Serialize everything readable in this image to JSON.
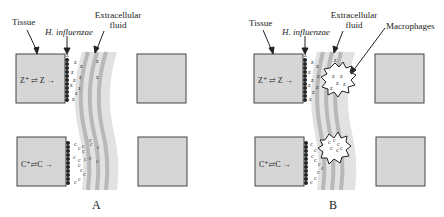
{
  "panels": [
    {
      "id": "A",
      "letter": "A",
      "labels": {
        "tissue": "Tissue",
        "bacteria": "H. influenzae",
        "fluid_line1": "Extracellular",
        "fluid_line2": "fluid"
      },
      "equations": {
        "top": "Z⁺ ⇄ Z →",
        "bottom": "C⁺⇄C →"
      }
    },
    {
      "id": "B",
      "letter": "B",
      "labels": {
        "tissue": "Tissue",
        "bacteria": "H. influenzae",
        "fluid_line1": "Extracellular",
        "fluid_line2": "fluid",
        "macrophages": "Macrophages"
      },
      "equations": {
        "top": "Z⁺ ⇄ Z →",
        "bottom": "C⁺⇄C →"
      }
    }
  ],
  "colors": {
    "tissue_fill": "#d6d6d6",
    "tissue_border": "#444444",
    "fluid_band_light": "#dcdcdc",
    "fluid_band_dark": "#b8b8b8",
    "bacteria": "#222222",
    "macrophage_fill": "#ffffff"
  }
}
